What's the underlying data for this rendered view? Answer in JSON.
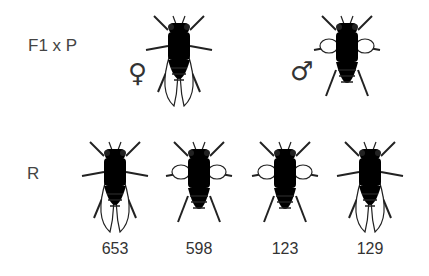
{
  "cross": {
    "label": "F1 x P",
    "female": {
      "symbol": "♀",
      "phenotype": "wild-type (light body, long wings)"
    },
    "male": {
      "symbol": "♂",
      "phenotype": "dark body, vestigial wings"
    }
  },
  "progeny": {
    "label": "R",
    "classes": [
      {
        "phenotype": "light body, long wings",
        "count": "653"
      },
      {
        "phenotype": "dark body, vestigial wings",
        "count": "598"
      },
      {
        "phenotype": "light body, vestigial wings",
        "count": "123"
      },
      {
        "phenotype": "dark body, long wings",
        "count": "129"
      }
    ]
  },
  "colors": {
    "light_body": "#f4f4f4",
    "dark_body": "#555555",
    "outline": "#222222"
  }
}
